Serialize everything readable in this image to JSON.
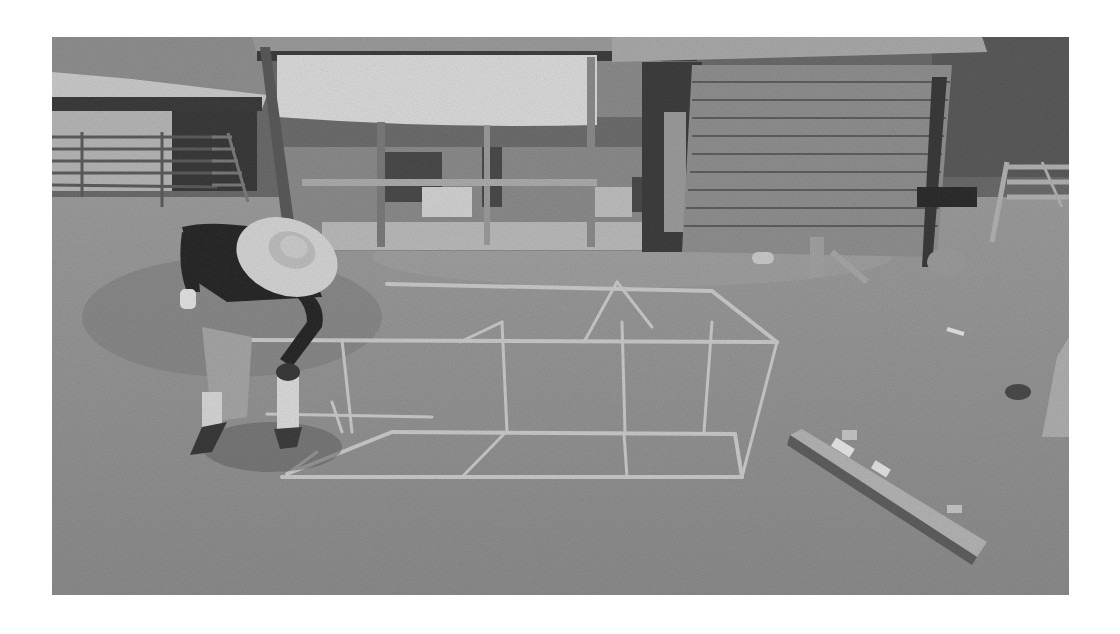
{
  "image": {
    "kind": "photograph",
    "mode": "grayscale",
    "frame": {
      "x": 52,
      "y": 37,
      "width": 1017,
      "height": 558
    },
    "background_color": "#ffffff",
    "scene": {
      "description": "Person in a wide-brimmed hat assembling a rectangular PVC pipe frame on a grassy yard in front of an open-front shed with a tarp",
      "subjects": [
        {
          "name": "person",
          "attributes": [
            "wide-brimmed straw hat",
            "dark long-sleeve shirt",
            "light shorts",
            "bending over"
          ]
        },
        {
          "name": "pvc-frame",
          "attributes": [
            "rectangular box frame",
            "three bays",
            "light pipes"
          ]
        },
        {
          "name": "wood-plank",
          "attributes": [
            "lying diagonally on grass",
            "lower right"
          ]
        },
        {
          "name": "shed",
          "attributes": [
            "horizontal lap siding",
            "metal roof"
          ]
        },
        {
          "name": "open-carport",
          "attributes": [
            "hanging white tarp",
            "equipment underneath"
          ]
        },
        {
          "name": "livestock-shelter",
          "attributes": [
            "upper left",
            "metal gate panels"
          ]
        },
        {
          "name": "fence-gate",
          "attributes": [
            "upper right",
            "wooden"
          ]
        },
        {
          "name": "trees",
          "attributes": [
            "background foliage"
          ]
        }
      ]
    },
    "colors": {
      "grass": "#8c8c8c",
      "grass_dark": "#767676",
      "tarp": "#d8d8d8",
      "shed_wall": "#8a8a8a",
      "roof": "#a8a8a8",
      "shirt": "#2a2a2a",
      "hat": "#d2d2d2",
      "pipe": "#c8c8c8",
      "trees": "#5e5e5e"
    }
  }
}
